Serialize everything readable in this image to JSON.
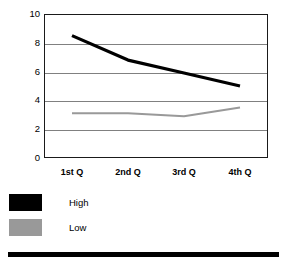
{
  "chart_data": {
    "type": "line",
    "title": "",
    "subtitle": "",
    "xlabel": "",
    "ylabel": "",
    "categories": [
      "1st Q",
      "2nd Q",
      "3rd Q",
      "4th Q"
    ],
    "series": [
      {
        "name": "High",
        "color": "#000000",
        "values": [
          8.5,
          6.8,
          5.9,
          5.0
        ]
      },
      {
        "name": "Low",
        "color": "#999999",
        "values": [
          3.1,
          3.1,
          2.9,
          3.5
        ]
      }
    ],
    "ylim": [
      0,
      10
    ],
    "yticks": [
      0,
      2,
      4,
      6,
      8,
      10
    ],
    "ytick_labels": [
      "0",
      "2",
      "4",
      "6",
      "8",
      "10"
    ],
    "grid": true,
    "grid_color": "#808080",
    "legend_position": "bottom-left",
    "plot_background": "#ffffff",
    "frame_color": "#1a1a1a"
  },
  "legend": {
    "entries": [
      {
        "label": "High",
        "color": "#000000"
      },
      {
        "label": "Low",
        "color": "#999999"
      }
    ]
  },
  "axes": {
    "y_tick_labels": [
      "10",
      "8",
      "6",
      "4",
      "2",
      "0"
    ],
    "x_tick_labels": [
      "1st Q",
      "2nd Q",
      "3rd Q",
      "4th Q"
    ]
  },
  "decoration": {
    "bottom_rule_color": "#000000"
  }
}
